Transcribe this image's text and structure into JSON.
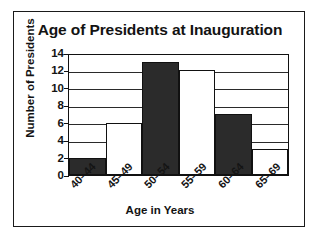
{
  "chart_data": {
    "type": "bar",
    "title": "Age of Presidents at Inauguration",
    "xlabel": "Age in Years",
    "ylabel": "Number of Presidents",
    "categories": [
      "40–44",
      "45–49",
      "50–54",
      "55–59",
      "60–64",
      "65–69"
    ],
    "values": [
      2,
      6,
      13,
      12,
      7,
      3
    ],
    "bar_styles": [
      "filled",
      "hollow",
      "filled",
      "hollow",
      "filled",
      "hollow"
    ],
    "ylim": [
      0,
      14
    ],
    "ytick_labels": [
      "14",
      "12",
      "10",
      "8",
      "6",
      "4",
      "2",
      "0"
    ],
    "ytick_values": [
      14,
      12,
      10,
      8,
      6,
      4,
      2,
      0
    ],
    "grid": true,
    "grid_axis": "y",
    "legend": null,
    "colors": {
      "bar_filled": "#2b2b2b",
      "bar_hollow": "#ffffff",
      "outline": "#111111",
      "text": "#131313",
      "background": "#ffffff",
      "frame": "#1a1a1a"
    }
  }
}
